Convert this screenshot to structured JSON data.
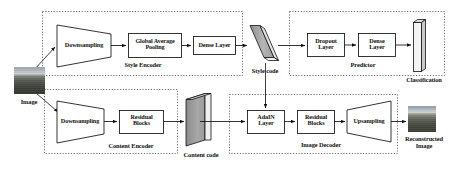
{
  "figure": {
    "type": "block-diagram"
  },
  "colors": {
    "stroke": "#111111",
    "dashed_group": "#444444",
    "node_fill": "#ffffff",
    "code_fill": "#a9a9a9",
    "code_side": "#e8e8e8",
    "background": "#ffffff"
  },
  "images": {
    "source": {
      "label": "Image"
    },
    "reconstructed": {
      "label": "Reconstructed\nImage"
    }
  },
  "groups": [
    {
      "id": "style-encoder",
      "label": "Style Encoder"
    },
    {
      "id": "predictor",
      "label": "Predictor"
    },
    {
      "id": "content-encoder",
      "label": "Content Encoder"
    },
    {
      "id": "image-decoder",
      "label": "Image Decoder"
    }
  ],
  "nodes": {
    "style_downsampling": {
      "label": "Downsampling",
      "shape": "trapezoid"
    },
    "global_avg_pooling": {
      "label": "Global Average\nPooling",
      "shape": "rect"
    },
    "style_dense_layer": {
      "label": "Dense Layer",
      "shape": "rect"
    },
    "dropout_layer": {
      "label": "Dropout\nLayer",
      "shape": "rect"
    },
    "pred_dense_layer": {
      "label": "Dense\nLayer",
      "shape": "rect"
    },
    "content_downsampling": {
      "label": "Downsampling",
      "shape": "trapezoid"
    },
    "content_residual_blocks": {
      "label": "Residual\nBlocks",
      "shape": "rect"
    },
    "adain_layer": {
      "label": "AdaIN\nLayer",
      "shape": "rect"
    },
    "decoder_residual_blocks": {
      "label": "Residual\nBlocks",
      "shape": "rect"
    },
    "upsampling": {
      "label": "Upsampling",
      "shape": "trapezoid-right"
    }
  },
  "codes": {
    "style_code": {
      "label": "Style code",
      "shape": "slanted-3d-bar"
    },
    "content_code": {
      "label": "Content code",
      "shape": "3d-slab"
    },
    "classification": {
      "label": "Classification",
      "shape": "3d-vertical-bar"
    }
  }
}
